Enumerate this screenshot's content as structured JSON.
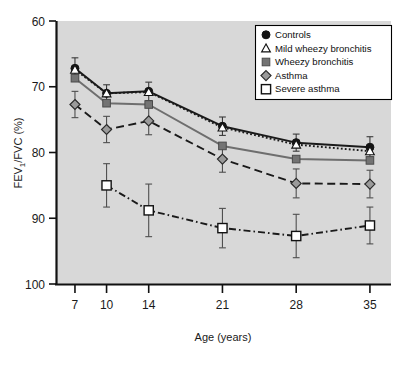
{
  "figure": {
    "background_color": "#ffffff",
    "plot_background_color": "#d8d8d8",
    "axis_color": "#111111"
  },
  "axes": {
    "y_title": "FEV₁/FVC (%)",
    "x_title": "Age (years)",
    "y_ticks": [
      "100",
      "90",
      "80",
      "70",
      "60"
    ],
    "x_ticks": [
      "7",
      "10",
      "14",
      "21",
      "28",
      "35"
    ]
  },
  "legend": {
    "position": "top-right",
    "entries": [
      {
        "label": "Controls",
        "marker": "filled-circle-icon",
        "color": "#1a1a1a"
      },
      {
        "label": "Mild wheezy bronchitis",
        "marker": "open-triangle-icon",
        "color": "#1a1a1a"
      },
      {
        "label": "Wheezy bronchitis",
        "marker": "filled-square-icon",
        "color": "#666666"
      },
      {
        "label": "Asthma",
        "marker": "grey-diamond-icon",
        "color": "#8a8a8a"
      },
      {
        "label": "Severe asthma",
        "marker": "open-square-icon",
        "color": "#ffffff"
      }
    ]
  },
  "chart_data": {
    "type": "line",
    "title": "",
    "xlabel": "Age (years)",
    "ylabel": "FEV₁/FVC (%)",
    "xlim": [
      5.2,
      37.0
    ],
    "ylim": [
      57.5,
      100.8
    ],
    "x": [
      7,
      10,
      14,
      21,
      28,
      35
    ],
    "xticks": [
      7,
      10,
      14,
      21,
      28,
      35
    ],
    "yticks": [
      60,
      70,
      80,
      90,
      100
    ],
    "grid": false,
    "legend_position": "upper right",
    "series": [
      {
        "name": "Controls",
        "color": "#1a1a1a",
        "linestyle": "solid",
        "marker": "filled-circle",
        "x": [
          7,
          10,
          14,
          21,
          28,
          35
        ],
        "values": [
          92.8,
          89.0,
          89.3,
          84.0,
          81.5,
          80.8
        ],
        "error": [
          1.6,
          1.3,
          1.4,
          1.4,
          1.3,
          1.6
        ]
      },
      {
        "name": "Mild wheezy bronchitis",
        "color": "#1a1a1a",
        "linestyle": "dotted",
        "marker": "open-triangle",
        "x": [
          7,
          10,
          14,
          21,
          28,
          35
        ],
        "values": [
          92.6,
          89.0,
          89.2,
          83.8,
          81.2,
          80.2
        ],
        "error": [
          0,
          0,
          0,
          0,
          0,
          0
        ]
      },
      {
        "name": "Wheezy bronchitis",
        "color": "#6e6e6e",
        "linestyle": "solid",
        "marker": "filled-square",
        "x": [
          7,
          10,
          14,
          21,
          28,
          35
        ],
        "values": [
          91.3,
          87.5,
          87.3,
          81.0,
          79.0,
          78.8
        ],
        "error": [
          0,
          0,
          0,
          0,
          0,
          0
        ]
      },
      {
        "name": "Asthma",
        "color": "#1a1a1a",
        "linestyle": "dashed",
        "marker": "grey-diamond",
        "x": [
          7,
          10,
          14,
          21,
          28,
          35
        ],
        "values": [
          87.3,
          83.5,
          84.8,
          79.0,
          75.3,
          75.2
        ],
        "error": [
          2.0,
          2.0,
          2.1,
          2.0,
          2.2,
          2.1
        ]
      },
      {
        "name": "Severe asthma",
        "color": "#1a1a1a",
        "linestyle": "dash-dot",
        "marker": "open-square",
        "x": [
          10,
          14,
          21,
          28,
          35
        ],
        "values": [
          75.0,
          71.2,
          68.5,
          67.3,
          68.9
        ],
        "error": [
          3.3,
          4.0,
          3.0,
          3.3,
          2.8
        ]
      }
    ]
  }
}
